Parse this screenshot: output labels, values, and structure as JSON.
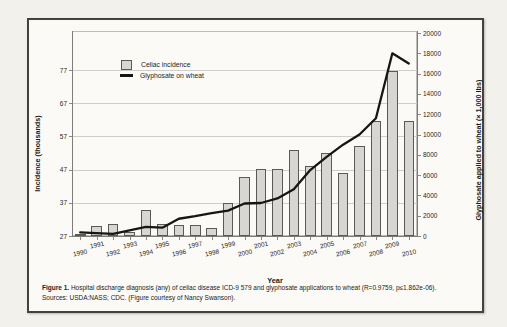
{
  "figure": {
    "caption_label": "Figure 1.",
    "caption_text": " Hospital discharge diagnosis (any) of celiac disease ICD-9 579 and glyphosate applications to wheat (R=0.9759, p≤1.862e-06).",
    "caption_sources": "Sources: USDA:NASS; CDC. (Figure courtesy of Nancy Swanson)."
  },
  "chart_data": {
    "type": "bar",
    "subtype": "bar+line dual axis",
    "title": "",
    "xlabel": "Year",
    "categories": [
      1990,
      1991,
      1992,
      1993,
      1994,
      1995,
      1996,
      1997,
      1998,
      1999,
      2000,
      2001,
      2002,
      2003,
      2004,
      2005,
      2006,
      2007,
      2008,
      2009,
      2010
    ],
    "series": [
      {
        "name": "Celiac incidence",
        "type": "bar",
        "axis": "left",
        "values": [
          27.6,
          30.0,
          30.7,
          28.2,
          34.8,
          30.7,
          30.3,
          30.3,
          29.5,
          37.0,
          44.8,
          47.2,
          47.2,
          52.8,
          48.1,
          51.9,
          46.0,
          54.1,
          61.5,
          76.7,
          61.5
        ]
      },
      {
        "name": "Glyphosate on wheat",
        "type": "line",
        "axis": "right",
        "values": [
          350,
          280,
          200,
          550,
          900,
          820,
          1700,
          1950,
          2250,
          2500,
          3200,
          3250,
          3700,
          4600,
          6500,
          7800,
          9000,
          10000,
          11600,
          18000,
          17000
        ]
      }
    ],
    "left_axis": {
      "label": "Incidence (thousands)",
      "ticks": [
        27,
        37,
        47,
        57,
        67,
        77
      ],
      "range": [
        27,
        77
      ]
    },
    "right_axis": {
      "label": "Glyphosate applied to wheat (× 1,000 lbs)",
      "ticks": [
        0,
        2000,
        4000,
        6000,
        8000,
        10000,
        12000,
        14000,
        16000,
        18000,
        20000
      ],
      "range": [
        0,
        20000
      ]
    },
    "legend": [
      "Celiac incidence",
      "Glyphosate on wheat"
    ],
    "legend_position": "top-left inside plot",
    "grid": "horizontal, light gray",
    "colors": {
      "bar_fill": "#d7d6d2",
      "bar_border": "#5a5955",
      "line": "#161616",
      "grid": "#cfceca",
      "figure_border": "#45423d",
      "background": "#fbfaf7"
    }
  }
}
